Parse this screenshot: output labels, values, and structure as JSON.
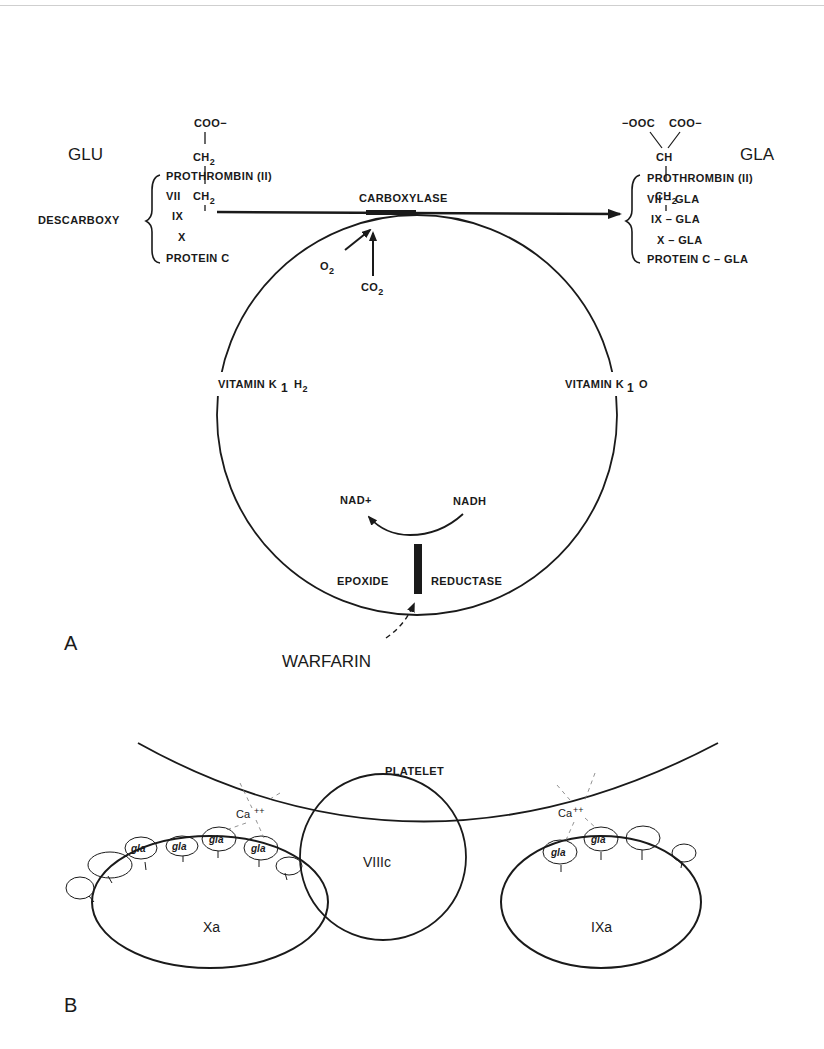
{
  "panel_a": {
    "label": "A",
    "glu": {
      "label": "GLU",
      "structure": [
        "COO−",
        "CH2",
        "CH2"
      ]
    },
    "gla": {
      "label": "GLA",
      "structure": [
        "−OOC",
        "COO−",
        "CH",
        "CH2"
      ]
    },
    "descarboxy": {
      "label": "DESCARBOXY",
      "items": [
        "PROTHROMBIN (II)",
        "VII",
        "IX",
        "X",
        "PROTEIN C"
      ]
    },
    "carboxylated": {
      "items": [
        "PROTHROMBIN (II)",
        "VII – GLA",
        "IX – GLA",
        "X – GLA",
        "PROTEIN C  – GLA"
      ]
    },
    "enzyme_carboxylase": "CARBOXYLASE",
    "cofactor_o2": "O",
    "cofactor_co2": "CO",
    "subscript_2": "2",
    "subscript_1": "1",
    "vitamin_k_h2": {
      "prefix": "VITAMIN K",
      "sub": "1",
      "suffix": "H"
    },
    "vitamin_k_o": {
      "prefix": "VITAMIN K",
      "sub": "1",
      "suffix": "O"
    },
    "nad_plus": "NAD+",
    "nadh": "NADH",
    "epoxide": "EPOXIDE",
    "reductase": "REDUCTASE",
    "warfarin": "WARFARIN"
  },
  "panel_b": {
    "label": "B",
    "platelet": "PLATELET",
    "factor_viiic": "VIIIc",
    "factor_xa": "Xa",
    "factor_ixa": "IXa",
    "calcium": "Ca",
    "calcium_charge": "++",
    "gla_label": "gla"
  }
}
